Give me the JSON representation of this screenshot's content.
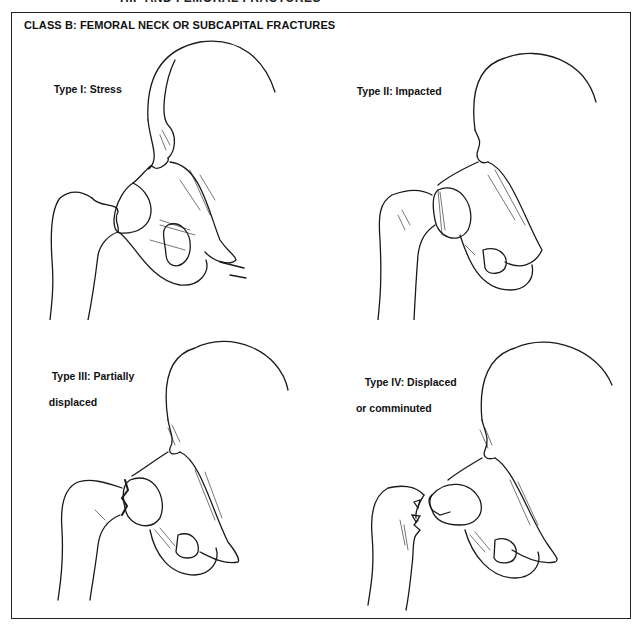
{
  "header_cut": "HIP AND FEMORAL FRACTURES",
  "figure": {
    "title": "CLASS B: FEMORAL NECK OR SUBCAPITAL FRACTURES",
    "panels": [
      {
        "id": "type-1",
        "label_line1": "Type I: Stress",
        "label_line2": ""
      },
      {
        "id": "type-2",
        "label_line1": "Type II: Impacted",
        "label_line2": ""
      },
      {
        "id": "type-3",
        "label_line1": "Type III: Partially",
        "label_line2": "   displaced"
      },
      {
        "id": "type-4",
        "label_line1": "Type IV: Displaced",
        "label_line2": " or comminuted"
      }
    ]
  },
  "colors": {
    "line": "#1a1a1a",
    "background": "#ffffff",
    "frame": "#222222"
  }
}
